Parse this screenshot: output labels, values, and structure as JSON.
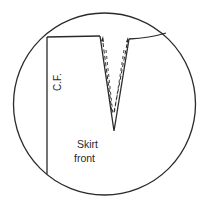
{
  "diagram": {
    "type": "sewing-pattern-detail",
    "labels": {
      "center_front": "C.F.",
      "piece_line1": "Skirt",
      "piece_line2": "front"
    },
    "colors": {
      "line": "#2a2a2a",
      "background": "#ffffff"
    },
    "elements": [
      {
        "name": "detail-circle",
        "shape": "circle"
      },
      {
        "name": "center-front-line",
        "shape": "line"
      },
      {
        "name": "waistline",
        "shape": "polyline"
      },
      {
        "name": "dart",
        "shape": "v",
        "style": "solid outer legs with dashed inner stitching lines"
      }
    ]
  }
}
